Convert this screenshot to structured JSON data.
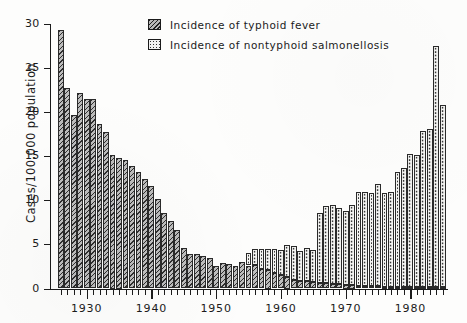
{
  "chart_data": {
    "type": "bar",
    "title": "",
    "subtitle": "",
    "xlabel": "",
    "ylabel": "Cases/100,000 population",
    "ylim": [
      0,
      30
    ],
    "xlim": [
      1926,
      1986
    ],
    "ytick_labels": [
      "0",
      "5",
      "10",
      "15",
      "20",
      "25",
      "30"
    ],
    "ytick_values": [
      0,
      5,
      10,
      15,
      20,
      25,
      30
    ],
    "xtick_labels": [
      "1930",
      "1940",
      "1950",
      "1960",
      "1970",
      "1980"
    ],
    "xtick_values": [
      1930,
      1940,
      1950,
      1960,
      1970,
      1980
    ],
    "grid": false,
    "legend_position": "top-right",
    "stacked": true,
    "legend": [
      {
        "label": "Incidence of typhoid fever",
        "pattern": "diagonal-hatch",
        "series": "typhoid"
      },
      {
        "label": "Incidence of nontyphoid   salmonellosis",
        "pattern": "dotted",
        "series": "nontyphoid"
      }
    ],
    "x": [
      1926,
      1927,
      1928,
      1929,
      1930,
      1931,
      1932,
      1933,
      1934,
      1935,
      1936,
      1937,
      1938,
      1939,
      1940,
      1941,
      1942,
      1943,
      1944,
      1945,
      1946,
      1947,
      1948,
      1949,
      1950,
      1951,
      1952,
      1953,
      1954,
      1955,
      1956,
      1957,
      1958,
      1959,
      1960,
      1961,
      1962,
      1963,
      1964,
      1965,
      1966,
      1967,
      1968,
      1969,
      1970,
      1971,
      1972,
      1973,
      1974,
      1975,
      1976,
      1977,
      1978,
      1979,
      1980,
      1981,
      1982,
      1983,
      1984,
      1985
    ],
    "series": [
      {
        "name": "Incidence of typhoid fever",
        "pattern": "diagonal-hatch",
        "values": [
          29.3,
          22.7,
          19.7,
          22.2,
          21.5,
          21.5,
          18.7,
          17.7,
          15.2,
          14.8,
          14.6,
          13.9,
          13.2,
          12.4,
          11.6,
          10.2,
          8.6,
          7.7,
          6.6,
          4.6,
          3.9,
          3.9,
          3.7,
          3.5,
          2.6,
          2.9,
          2.8,
          2.6,
          3.0,
          2.6,
          2.7,
          2.2,
          2.1,
          1.8,
          1.5,
          1.3,
          1.0,
          0.9,
          0.8,
          0.7,
          0.6,
          0.6,
          0.5,
          0.5,
          0.4,
          0.4,
          0.3,
          0.3,
          0.3,
          0.3,
          0.2,
          0.2,
          0.2,
          0.2,
          0.2,
          0.2,
          0.2,
          0.2,
          0.2,
          0.2
        ]
      },
      {
        "name": "Incidence of nontyphoid   salmonellosis",
        "pattern": "dotted",
        "values": [
          0,
          0,
          0,
          0,
          0,
          0,
          0,
          0,
          0,
          0,
          0,
          0,
          0,
          0,
          0,
          0,
          0,
          0,
          0,
          0,
          0,
          0,
          0,
          0,
          0,
          0,
          0,
          0,
          0,
          1.4,
          1.8,
          2.3,
          2.4,
          2.7,
          2.9,
          3.6,
          3.8,
          3.4,
          3.8,
          3.7,
          8.0,
          8.8,
          9.0,
          8.6,
          8.4,
          9.1,
          10.7,
          10.6,
          10.5,
          11.6,
          10.6,
          10.7,
          13.0,
          13.5,
          15.1,
          14.9,
          17.7,
          17.9,
          27.3,
          20.6
        ]
      }
    ]
  }
}
